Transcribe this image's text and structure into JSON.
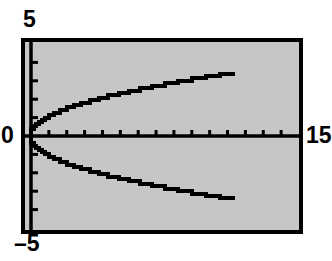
{
  "figure": {
    "background_color": "#ffffff",
    "plot_background_color": "#c6c6c6",
    "frame_color": "#000000",
    "curve_color": "#000000"
  },
  "labels": {
    "y_max": "5",
    "y_min": "–5",
    "origin": "0",
    "x_max": "15"
  },
  "chart_data": {
    "type": "line",
    "title": "",
    "subtitle": "",
    "xlabel": "",
    "ylabel": "",
    "xlim": [
      0,
      15
    ],
    "ylim": [
      -5,
      5
    ],
    "x_tick_labels": [
      "0",
      "15"
    ],
    "y_tick_labels": [
      "5",
      "-5"
    ],
    "x_tick_interval": 1,
    "y_tick_interval": 1,
    "x_tick_count": 14,
    "y_tick_count": 9,
    "grid": false,
    "legend": null,
    "legend_position": "none",
    "annotations": [],
    "style": "graphing-calculator",
    "equation": "y = ±√x",
    "series": [
      {
        "name": "y = +√x",
        "x": [
          0.0,
          0.15,
          0.3,
          0.45,
          0.6,
          0.8,
          1.0,
          1.3,
          1.6,
          2.0,
          2.4,
          2.8,
          3.3,
          3.8,
          4.3,
          4.9,
          5.5,
          6.1,
          6.8,
          7.5,
          8.2,
          9.0,
          9.8,
          10.6,
          11.4
        ],
        "values": [
          0.0,
          0.39,
          0.55,
          0.67,
          0.77,
          0.89,
          1.0,
          1.14,
          1.26,
          1.41,
          1.55,
          1.67,
          1.82,
          1.95,
          2.07,
          2.21,
          2.35,
          2.47,
          2.61,
          2.74,
          2.86,
          3.0,
          3.13,
          3.26,
          3.38
        ]
      },
      {
        "name": "y = −√x",
        "x": [
          0.0,
          0.15,
          0.3,
          0.45,
          0.6,
          0.8,
          1.0,
          1.3,
          1.6,
          2.0,
          2.4,
          2.8,
          3.3,
          3.8,
          4.3,
          4.9,
          5.5,
          6.1,
          6.8,
          7.5,
          8.2,
          9.0,
          9.8,
          10.6,
          11.4
        ],
        "values": [
          0.0,
          -0.39,
          -0.55,
          -0.67,
          -0.77,
          -0.89,
          -1.0,
          -1.14,
          -1.26,
          -1.41,
          -1.55,
          -1.67,
          -1.82,
          -1.95,
          -2.07,
          -2.21,
          -2.35,
          -2.47,
          -2.61,
          -2.74,
          -2.86,
          -3.0,
          -3.13,
          -3.26,
          -3.38
        ]
      }
    ]
  }
}
